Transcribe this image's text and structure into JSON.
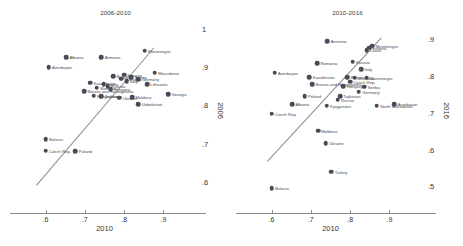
{
  "chart_data": [
    {
      "type": "scatter",
      "title": "2006-2010",
      "xlabel": "2010",
      "ylabel": "2006",
      "xlim": [
        0.54,
        0.96
      ],
      "ylim": [
        0.55,
        1.02
      ],
      "xticks": [
        ".6",
        ".7",
        ".8",
        ".9"
      ],
      "xtickvals": [
        0.6,
        0.7,
        0.8,
        0.9
      ],
      "yticks": [
        "1",
        ".9",
        ".8",
        ".7",
        ".6"
      ],
      "ytickvals": [
        1.0,
        0.9,
        0.8,
        0.7,
        0.6
      ],
      "grid": false,
      "legend": "none",
      "fit_line": {
        "x0": 0.575,
        "y0": 0.595,
        "x1": 0.875,
        "y1": 0.955
      },
      "points": [
        {
          "label": "Montenegro",
          "x": 0.852,
          "y": 0.945,
          "side": "right"
        },
        {
          "label": "Albania",
          "x": 0.652,
          "y": 0.928,
          "side": "right"
        },
        {
          "label": "Armenia",
          "x": 0.742,
          "y": 0.928,
          "side": "right"
        },
        {
          "label": "Azerbaijan",
          "x": 0.608,
          "y": 0.902,
          "side": "right"
        },
        {
          "label": "Macedonia",
          "x": 0.878,
          "y": 0.888,
          "side": "right"
        },
        {
          "label": "Kosovo",
          "x": 0.8,
          "y": 0.882,
          "side": "right"
        },
        {
          "label": "Bulgaria",
          "x": 0.772,
          "y": 0.878,
          "side": "right"
        },
        {
          "label": "Serbia",
          "x": 0.818,
          "y": 0.876,
          "side": "right"
        },
        {
          "label": "Romania",
          "x": 0.792,
          "y": 0.872,
          "side": "right"
        },
        {
          "label": "Germany",
          "x": 0.836,
          "y": 0.87,
          "side": "right"
        },
        {
          "label": "Italy",
          "x": 0.806,
          "y": 0.866,
          "side": "right"
        },
        {
          "label": "Lithuania",
          "x": 0.858,
          "y": 0.858,
          "side": "right"
        },
        {
          "label": "Kazakhstan",
          "x": 0.714,
          "y": 0.862,
          "side": "right"
        },
        {
          "label": "Latvia",
          "x": 0.748,
          "y": 0.858,
          "side": "right"
        },
        {
          "label": "Estonia",
          "x": 0.758,
          "y": 0.852,
          "side": "right"
        },
        {
          "label": "Slovakia",
          "x": 0.73,
          "y": 0.848,
          "side": "right"
        },
        {
          "label": "Hungary",
          "x": 0.766,
          "y": 0.844,
          "side": "right"
        },
        {
          "label": "Bosnia and Herzegovina",
          "x": 0.698,
          "y": 0.84,
          "side": "right"
        },
        {
          "label": "Georgia",
          "x": 0.912,
          "y": 0.832,
          "side": "right"
        },
        {
          "label": "Kyrgyzstan",
          "x": 0.722,
          "y": 0.828,
          "side": "right"
        },
        {
          "label": "Tajikistan",
          "x": 0.742,
          "y": 0.826,
          "side": "right"
        },
        {
          "label": "Moldova",
          "x": 0.82,
          "y": 0.824,
          "side": "right"
        },
        {
          "label": "Ukraine",
          "x": 0.788,
          "y": 0.822,
          "side": "right"
        },
        {
          "label": "Uzbekistan",
          "x": 0.836,
          "y": 0.806,
          "side": "right"
        },
        {
          "label": "Belarus",
          "x": 0.6,
          "y": 0.714,
          "side": "right"
        },
        {
          "label": "Czech Rep.",
          "x": 0.6,
          "y": 0.684,
          "side": "right"
        },
        {
          "label": "Poland",
          "x": 0.676,
          "y": 0.682,
          "side": "right"
        }
      ]
    },
    {
      "type": "scatter",
      "title": "2010-2016",
      "xlabel": "2010",
      "ylabel": "2016",
      "xlim": [
        0.54,
        0.96
      ],
      "ylim": [
        0.46,
        0.95
      ],
      "xticks": [
        ".6",
        ".7",
        ".8",
        ".9"
      ],
      "xtickvals": [
        0.6,
        0.7,
        0.8,
        0.9
      ],
      "yticks": [
        ".9",
        ".8",
        ".7",
        ".6",
        ".5"
      ],
      "ytickvals": [
        0.9,
        0.8,
        0.7,
        0.6,
        0.5
      ],
      "grid": false,
      "legend": "none",
      "fit_line": {
        "x0": 0.588,
        "y0": 0.572,
        "x1": 0.878,
        "y1": 0.908
      },
      "points": [
        {
          "label": "Armenia",
          "x": 0.742,
          "y": 0.898,
          "side": "right"
        },
        {
          "label": "Montenegro",
          "x": 0.856,
          "y": 0.886,
          "side": "right"
        },
        {
          "label": "Estonia",
          "x": 0.848,
          "y": 0.88,
          "side": "right"
        },
        {
          "label": "Latvia",
          "x": 0.842,
          "y": 0.874,
          "side": "right"
        },
        {
          "label": "Kosovo",
          "x": 0.806,
          "y": 0.842,
          "side": "right"
        },
        {
          "label": "Romania",
          "x": 0.716,
          "y": 0.838,
          "side": "right"
        },
        {
          "label": "Italy",
          "x": 0.828,
          "y": 0.822,
          "side": "right"
        },
        {
          "label": "Azerbaijan",
          "x": 0.608,
          "y": 0.812,
          "side": "right"
        },
        {
          "label": "Kazakhstan",
          "x": 0.696,
          "y": 0.8,
          "side": "right"
        },
        {
          "label": "Bulgaria",
          "x": 0.792,
          "y": 0.8,
          "side": "right"
        },
        {
          "label": "Slovakia",
          "x": 0.812,
          "y": 0.798,
          "side": "right"
        },
        {
          "label": "Montenegro",
          "x": 0.842,
          "y": 0.798,
          "side": "right"
        },
        {
          "label": "Czech Rep.",
          "x": 0.8,
          "y": 0.788,
          "side": "right"
        },
        {
          "label": "Bosnia and Herzegovina",
          "x": 0.704,
          "y": 0.78,
          "side": "right"
        },
        {
          "label": "Hungary",
          "x": 0.782,
          "y": 0.776,
          "side": "right"
        },
        {
          "label": "Serbia",
          "x": 0.836,
          "y": 0.774,
          "side": "right"
        },
        {
          "label": "Germany",
          "x": 0.822,
          "y": 0.76,
          "side": "right"
        },
        {
          "label": "Poland",
          "x": 0.684,
          "y": 0.748,
          "side": "right"
        },
        {
          "label": "Tajikistan",
          "x": 0.774,
          "y": 0.748,
          "side": "right"
        },
        {
          "label": "Russia",
          "x": 0.768,
          "y": 0.738,
          "side": "right"
        },
        {
          "label": "Albania",
          "x": 0.652,
          "y": 0.726,
          "side": "right"
        },
        {
          "label": "Kyrgyzstan",
          "x": 0.74,
          "y": 0.722,
          "side": "right"
        },
        {
          "label": "North Macedonia",
          "x": 0.868,
          "y": 0.722,
          "side": "right"
        },
        {
          "label": "Azerbaijan",
          "x": 0.912,
          "y": 0.726,
          "side": "right"
        },
        {
          "label": "Czech Rep.",
          "x": 0.6,
          "y": 0.7,
          "side": "right"
        },
        {
          "label": "Moldova",
          "x": 0.718,
          "y": 0.654,
          "side": "right"
        },
        {
          "label": "Ukraine",
          "x": 0.738,
          "y": 0.62,
          "side": "right"
        },
        {
          "label": "Turkey",
          "x": 0.752,
          "y": 0.542,
          "side": "right"
        },
        {
          "label": "Belarus",
          "x": 0.6,
          "y": 0.498,
          "side": "right"
        }
      ]
    }
  ]
}
